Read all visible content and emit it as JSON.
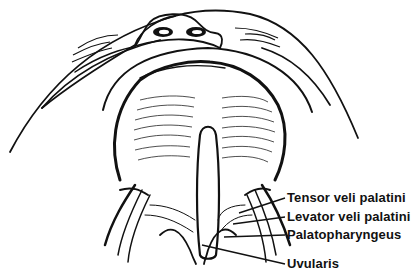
{
  "figure": {
    "colors": {
      "ink": "#111111",
      "background": "#ffffff"
    }
  },
  "labels": [
    {
      "id": "tensor",
      "text": "Tensor veli palatini",
      "x": 287,
      "y": 191,
      "leader": [
        [
          285,
          198
        ],
        [
          239,
          213
        ]
      ]
    },
    {
      "id": "levator",
      "text": "Levator veli palatini",
      "x": 287,
      "y": 210,
      "leader": [
        [
          285,
          217
        ],
        [
          233,
          224
        ]
      ]
    },
    {
      "id": "palatopharyngeus",
      "text": "Palatopharyngeus",
      "x": 287,
      "y": 228,
      "leader": [
        [
          285,
          235
        ],
        [
          224,
          237
        ]
      ]
    },
    {
      "id": "uvularis",
      "text": "Uvularis",
      "x": 287,
      "y": 257,
      "leader": [
        [
          285,
          264
        ],
        [
          202,
          245
        ]
      ]
    }
  ]
}
